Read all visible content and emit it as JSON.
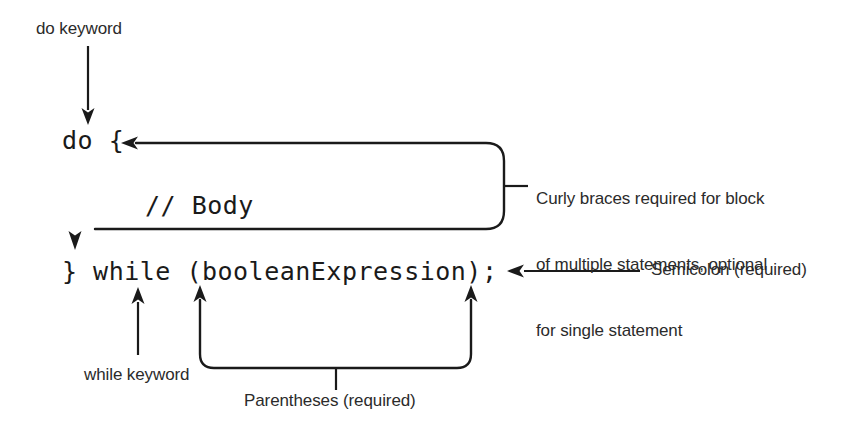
{
  "diagram": {
    "background_color": "#ffffff",
    "line_color": "#1a1a1a",
    "text_color": "#2b2b2b",
    "code_color": "#1a1a1a"
  },
  "code": {
    "line1": "do {",
    "line2": "// Body",
    "line3": "} while (booleanExpression);"
  },
  "annotations": {
    "do_keyword": "do keyword",
    "curly_braces_l1": "Curly braces required for block",
    "curly_braces_l2": "of multiple statements, optional",
    "curly_braces_l3": "for single statement",
    "semicolon": "Semicolon (required)",
    "while_keyword": "while keyword",
    "parentheses": "Parentheses (required)"
  }
}
